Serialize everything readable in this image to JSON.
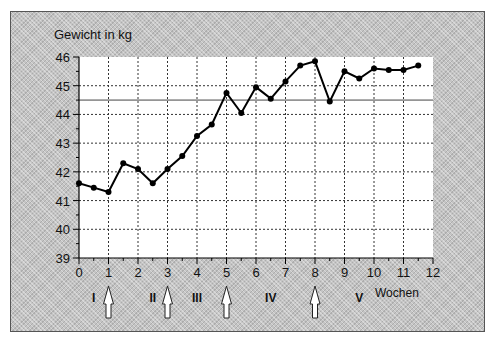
{
  "chart_data": {
    "type": "line",
    "title": "",
    "ylabel": "Gewicht in kg",
    "xlabel": "Wochen",
    "xlim": [
      0,
      12
    ],
    "ylim": [
      39,
      46
    ],
    "x_ticks": [
      0,
      1,
      2,
      3,
      4,
      5,
      6,
      7,
      8,
      9,
      10,
      11,
      12
    ],
    "y_ticks": [
      39,
      40,
      41,
      42,
      43,
      44,
      45,
      46
    ],
    "grid": true,
    "legend": null,
    "series": [
      {
        "name": "Gewicht",
        "x": [
          0,
          0.5,
          1,
          1.5,
          2,
          2.5,
          3,
          3.5,
          4,
          4.5,
          5,
          5.5,
          6,
          6.5,
          7,
          7.5,
          8,
          8.5,
          9,
          9.5,
          10,
          10.5,
          11,
          11.5
        ],
        "values": [
          41.6,
          41.45,
          41.3,
          42.3,
          42.1,
          41.6,
          42.1,
          42.55,
          43.25,
          43.65,
          44.75,
          44.05,
          44.95,
          44.55,
          45.15,
          45.7,
          45.85,
          44.45,
          45.5,
          45.25,
          45.6,
          45.55,
          45.55,
          45.7
        ]
      }
    ],
    "reference_line": {
      "y": 44.5
    },
    "phases": [
      {
        "label": "I",
        "x": 0.5
      },
      {
        "label": "II",
        "x": 2.5
      },
      {
        "label": "III",
        "x": 4.0
      },
      {
        "label": "IV",
        "x": 6.5
      },
      {
        "label": "V",
        "x": 9.5
      }
    ],
    "arrows_at_weeks": [
      1,
      3,
      5,
      8
    ]
  },
  "labels": {
    "y_axis_title": "Gewicht in kg",
    "x_axis_title": "Wochen"
  }
}
